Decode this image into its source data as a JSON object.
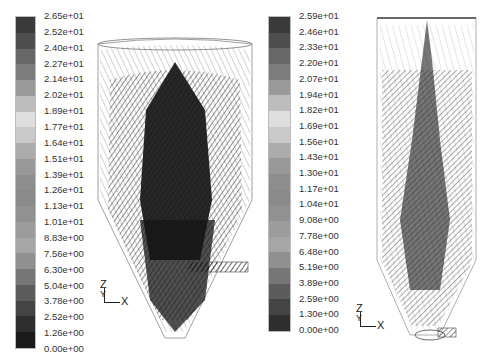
{
  "panels": [
    {
      "name": "left",
      "colorbar": {
        "labels": [
          "2.65e+01",
          "2.52e+01",
          "2.40e+01",
          "2.27e+01",
          "2.14e+01",
          "2.02e+01",
          "1.89e+01",
          "1.77e+01",
          "1.64e+01",
          "1.51e+01",
          "1.39e+01",
          "1.26e+01",
          "1.13e+01",
          "1.01e+01",
          "8.83e+00",
          "7.56e+00",
          "6.30e+00",
          "5.04e+00",
          "3.78e+00",
          "2.52e+00",
          "1.26e+00",
          "0.00e+00"
        ],
        "colors": [
          "#3a3a3a",
          "#4e4e4e",
          "#676767",
          "#7c7c7c",
          "#9a9a9a",
          "#bdbdbd",
          "#dedede",
          "#c9c9c9",
          "#ababab",
          "#989898",
          "#8e8e8e",
          "#8a8a8a",
          "#919191",
          "#9c9c9c",
          "#a6a6a6",
          "#909090",
          "#767676",
          "#5c5c5c",
          "#444444",
          "#2e2e2e",
          "#1a1a1a"
        ]
      },
      "axis_triad": {
        "z": "Z",
        "y": "Y",
        "x": "X"
      }
    },
    {
      "name": "right",
      "colorbar": {
        "labels": [
          "2.59e+01",
          "2.46e+01",
          "2.33e+01",
          "2.20e+01",
          "2.07e+01",
          "1.94e+01",
          "1.82e+01",
          "1.69e+01",
          "1.56e+01",
          "1.43e+01",
          "1.30e+01",
          "1.17e+01",
          "1.04e+01",
          "9.08e+00",
          "7.78e+00",
          "6.48e+00",
          "5.19e+00",
          "3.89e+00",
          "2.59e+00",
          "1.30e+00",
          "0.00e+00"
        ],
        "colors": [
          "#3a3a3a",
          "#4e4e4e",
          "#676767",
          "#7c7c7c",
          "#9a9a9a",
          "#bdbdbd",
          "#dedede",
          "#c9c9c9",
          "#ababab",
          "#989898",
          "#8e8e8e",
          "#8a8a8a",
          "#919191",
          "#9c9c9c",
          "#a6a6a6",
          "#909090",
          "#767676",
          "#5c5c5c",
          "#444444",
          "#2e2e2e"
        ]
      },
      "axis_triad": {
        "z": "Z",
        "y": "Y",
        "x": "X"
      }
    }
  ]
}
